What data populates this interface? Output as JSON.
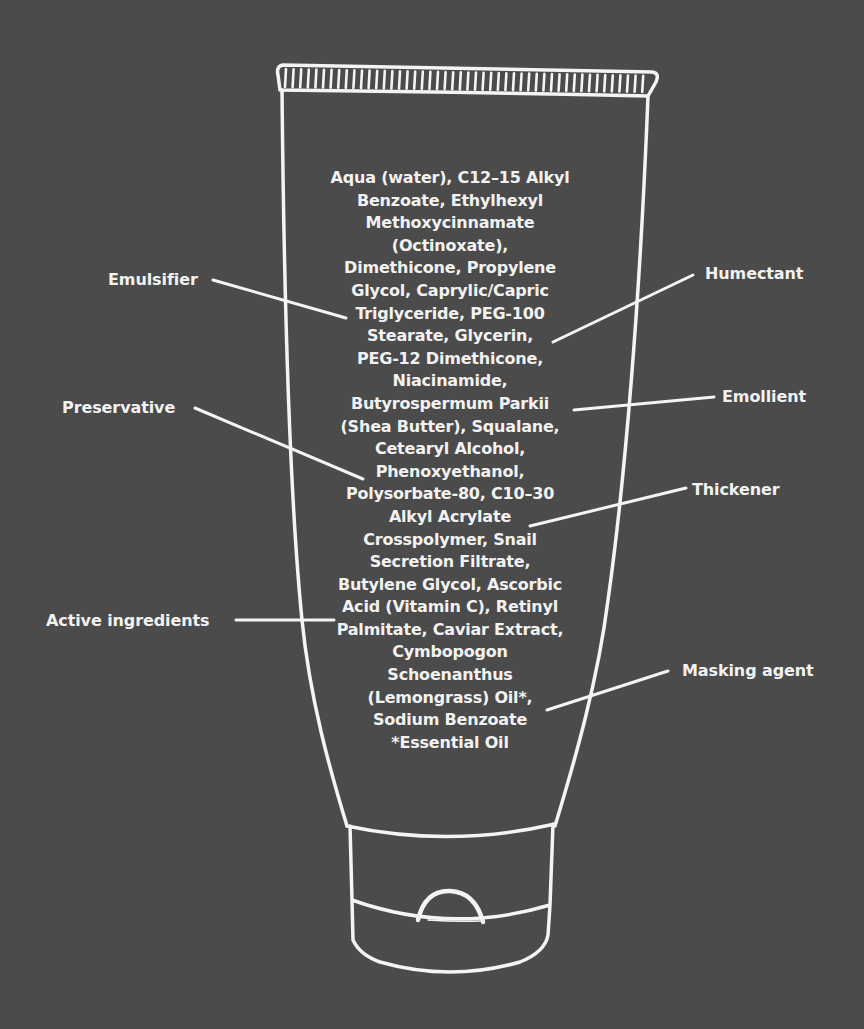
{
  "diagram": {
    "background_color": "#4b4b4b",
    "line_color": "#f4f4f4",
    "ingredient_lines": [
      "Aqua (water), C12–15 Alkyl",
      "Benzoate, Ethylhexyl",
      "Methoxycinnamate",
      "(Octinoxate),",
      "Dimethicone, Propylene",
      "Glycol, Caprylic/Capric",
      "Triglyceride, PEG-100",
      "Stearate, Glycerin,",
      "PEG-12 Dimethicone,",
      "Niacinamide,",
      "Butyrospermum Parkii",
      "(Shea Butter), Squalane,",
      "Cetearyl Alcohol,",
      "Phenoxyethanol,",
      "Polysorbate-80, C10–30",
      "Alkyl Acrylate",
      "Crosspolymer, Snail",
      "Secretion Filtrate,",
      "Butylene Glycol, Ascorbic",
      "Acid (Vitamin C), Retinyl",
      "Palmitate, Caviar Extract,",
      "Cymbopogon",
      "Schoenanthus",
      "(Lemongrass) Oil*,",
      "Sodium Benzoate",
      "*Essential Oil"
    ],
    "callouts": [
      {
        "label": "Emulsifier",
        "side": "left",
        "points_to": "Triglyceride, PEG-100"
      },
      {
        "label": "Humectant",
        "side": "right",
        "points_to": "Glycerin"
      },
      {
        "label": "Preservative",
        "side": "left",
        "points_to": "Phenoxyethanol"
      },
      {
        "label": "Emollient",
        "side": "right",
        "points_to": "Butyrospermum Parkii"
      },
      {
        "label": "Thickener",
        "side": "right",
        "points_to": "Alkyl Acrylate"
      },
      {
        "label": "Active ingredients",
        "side": "left",
        "points_to": "Acid (Vitamin C), Retinyl"
      },
      {
        "label": "Masking agent",
        "side": "right",
        "points_to": "(Lemongrass) Oil*"
      }
    ]
  }
}
